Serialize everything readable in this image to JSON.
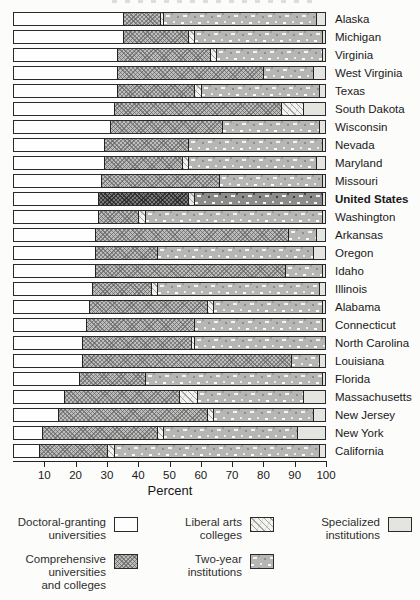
{
  "page": {
    "background": "#fcfcfa",
    "outline_color": "#2a2a2a",
    "comprehensive_gray": "#bdbdbd",
    "two_year_gray": "#b6b6b4",
    "specialized_gray": "#e4e4e0"
  },
  "chart_data": {
    "type": "bar",
    "subtype": "horizontal-stacked",
    "title": "",
    "xlabel": "Percent",
    "xlim": [
      0,
      100
    ],
    "x_ticks": [
      10,
      20,
      30,
      40,
      50,
      60,
      70,
      80,
      90,
      100
    ],
    "grid": false,
    "legend_position": "bottom",
    "series_keys": [
      "doctoral",
      "comprehensive",
      "liberal_arts",
      "two_year",
      "specialized"
    ],
    "series_names": [
      "Doctoral-granting universities",
      "Comprehensive universities and colleges",
      "Liberal arts colleges",
      "Two-year institutions",
      "Specialized institutions"
    ],
    "highlight_row": "United States",
    "rows": [
      {
        "label": "Alaska",
        "bold": false,
        "values": [
          35,
          12,
          1,
          49,
          3
        ]
      },
      {
        "label": "Michigan",
        "bold": false,
        "values": [
          35,
          21,
          2,
          41,
          1
        ]
      },
      {
        "label": "Virginia",
        "bold": false,
        "values": [
          33,
          30,
          2,
          34,
          1
        ]
      },
      {
        "label": "West Virginia",
        "bold": false,
        "values": [
          33,
          47,
          0,
          16,
          4
        ]
      },
      {
        "label": "Texas",
        "bold": false,
        "values": [
          33,
          25,
          2,
          38,
          2
        ]
      },
      {
        "label": "South Dakota",
        "bold": false,
        "values": [
          32,
          54,
          7,
          0,
          7
        ]
      },
      {
        "label": "Wisconsin",
        "bold": false,
        "values": [
          31,
          36,
          0,
          31,
          2
        ]
      },
      {
        "label": "Nevada",
        "bold": false,
        "values": [
          29,
          27,
          0,
          43,
          1
        ]
      },
      {
        "label": "Maryland",
        "bold": false,
        "values": [
          29,
          25,
          2,
          41,
          3
        ]
      },
      {
        "label": "Missouri",
        "bold": false,
        "values": [
          28,
          38,
          0,
          33,
          1
        ]
      },
      {
        "label": "United States",
        "bold": true,
        "values": [
          27,
          29,
          2,
          41,
          1
        ]
      },
      {
        "label": "Washington",
        "bold": false,
        "values": [
          27,
          13,
          2,
          57,
          1
        ]
      },
      {
        "label": "Arkansas",
        "bold": false,
        "values": [
          26,
          62,
          0,
          9,
          3
        ]
      },
      {
        "label": "Oregon",
        "bold": false,
        "values": [
          26,
          20,
          0,
          50,
          4
        ]
      },
      {
        "label": "Idaho",
        "bold": false,
        "values": [
          26,
          61,
          0,
          12,
          1
        ]
      },
      {
        "label": "Illinois",
        "bold": false,
        "values": [
          25,
          19,
          2,
          52,
          2
        ]
      },
      {
        "label": "Alabama",
        "bold": false,
        "values": [
          24,
          38,
          2,
          35,
          1
        ]
      },
      {
        "label": "Connecticut",
        "bold": false,
        "values": [
          23,
          35,
          0,
          41,
          1
        ]
      },
      {
        "label": "North Carolina",
        "bold": false,
        "values": [
          22,
          35,
          1,
          42,
          0
        ]
      },
      {
        "label": "Louisiana",
        "bold": false,
        "values": [
          22,
          67,
          0,
          9,
          2
        ]
      },
      {
        "label": "Florida",
        "bold": false,
        "values": [
          21,
          21,
          0,
          57,
          1
        ]
      },
      {
        "label": "Massachusetts",
        "bold": false,
        "values": [
          16,
          37,
          6,
          34,
          7
        ]
      },
      {
        "label": "New Jersey",
        "bold": false,
        "values": [
          14,
          48,
          2,
          32,
          4
        ]
      },
      {
        "label": "New York",
        "bold": false,
        "values": [
          9,
          37,
          2,
          43,
          9
        ]
      },
      {
        "label": "California",
        "bold": false,
        "values": [
          8,
          22,
          2,
          66,
          2
        ]
      }
    ]
  },
  "legend": {
    "items": [
      {
        "key": "doctoral",
        "label": "Doctoral-granting\nuniversities"
      },
      {
        "key": "comprehensive",
        "label": "Comprehensive\nuniversities\nand colleges"
      },
      {
        "key": "liberal_arts",
        "label": "Liberal arts\ncolleges"
      },
      {
        "key": "two_year",
        "label": "Two-year\ninstitutions"
      },
      {
        "key": "specialized",
        "label": "Specialized\ninstitutions"
      }
    ]
  }
}
